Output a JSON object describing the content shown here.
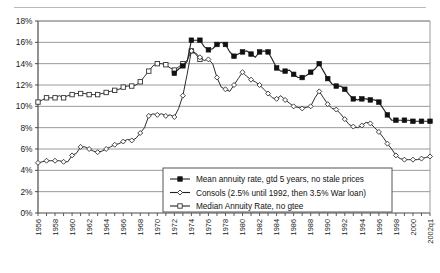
{
  "chart_data": {
    "type": "line",
    "title": "",
    "xlabel": "",
    "ylabel": "",
    "ylim": [
      0,
      18
    ],
    "ytick_labels": [
      "0%",
      "2%",
      "4%",
      "6%",
      "8%",
      "10%",
      "12%",
      "14%",
      "16%",
      "18%"
    ],
    "ytick_values": [
      0,
      2,
      4,
      6,
      8,
      10,
      12,
      14,
      16,
      18
    ],
    "xlim": [
      1956,
      2002
    ],
    "xtick_labels": [
      "1956",
      "1958",
      "1960",
      "1962",
      "1964",
      "1966",
      "1968",
      "1970",
      "1972",
      "1974",
      "1976",
      "1978",
      "1980",
      "1982",
      "1984",
      "1986",
      "1988",
      "1990",
      "1992",
      "1994",
      "1996",
      "1998",
      "2000",
      "2002q1"
    ],
    "xtick_values": [
      1956,
      1958,
      1960,
      1962,
      1964,
      1966,
      1968,
      1970,
      1972,
      1974,
      1976,
      1978,
      1980,
      1982,
      1984,
      1986,
      1988,
      1990,
      1992,
      1994,
      1996,
      1998,
      2000,
      2002
    ],
    "grid": "horizontal",
    "legend_position": "inside-bottom-center",
    "series": [
      {
        "name": "Mean annuity rate, gtd 5 years, no stale prices",
        "marker": "filled-square",
        "x": [
          1972,
          1972.5,
          1973,
          1973.5,
          1974,
          1974.5,
          1975,
          1975.5,
          1976,
          1976.5,
          1977,
          1977.5,
          1978,
          1978.5,
          1979,
          1979.5,
          1980,
          1980.5,
          1981,
          1981.5,
          1982,
          1982.5,
          1983,
          1983.5,
          1984,
          1984.5,
          1985,
          1985.5,
          1986,
          1986.5,
          1987,
          1987.5,
          1988,
          1988.5,
          1989,
          1989.5,
          1990,
          1990.5,
          1991,
          1991.5,
          1992,
          1992.5,
          1993,
          1993.5,
          1994,
          1994.5,
          1995,
          1995.5,
          1996,
          1996.5,
          1997,
          1997.5,
          1998,
          1998.5,
          1999,
          1999.5,
          2000,
          2000.5,
          2001,
          2001.5,
          2002
        ],
        "y": [
          13.1,
          13.5,
          13.8,
          14.2,
          16.2,
          16.2,
          16.2,
          15.6,
          15.3,
          15.4,
          15.8,
          16.0,
          15.8,
          15.1,
          14.7,
          14.9,
          15.1,
          15.2,
          14.9,
          14.6,
          15.1,
          15.2,
          15.1,
          14.4,
          13.6,
          13.3,
          13.3,
          13.4,
          13.0,
          12.7,
          12.7,
          12.9,
          13.2,
          13.5,
          14.0,
          13.3,
          12.6,
          12.1,
          11.9,
          11.9,
          11.6,
          11.1,
          10.7,
          10.6,
          10.7,
          10.7,
          10.6,
          10.6,
          10.4,
          9.8,
          9.2,
          8.7,
          8.7,
          8.7,
          8.7,
          8.7,
          8.6,
          8.6,
          8.6,
          8.6,
          8.6
        ]
      },
      {
        "name": "Consols (2.5% until 1992, then 3.5% War loan)",
        "marker": "open-diamond",
        "x": [
          1956,
          1956.5,
          1957,
          1957.5,
          1958,
          1958.5,
          1959,
          1959.5,
          1960,
          1960.5,
          1961,
          1961.5,
          1962,
          1962.5,
          1963,
          1963.5,
          1964,
          1964.5,
          1965,
          1965.5,
          1966,
          1966.5,
          1967,
          1967.5,
          1968,
          1968.5,
          1969,
          1969.5,
          1970,
          1970.5,
          1971,
          1971.5,
          1972,
          1972.5,
          1973,
          1973.5,
          1974,
          1974.5,
          1975,
          1975.5,
          1976,
          1976.5,
          1977,
          1977.5,
          1978,
          1978.5,
          1979,
          1979.5,
          1980,
          1980.5,
          1981,
          1981.5,
          1982,
          1982.5,
          1983,
          1983.5,
          1984,
          1984.5,
          1985,
          1985.5,
          1986,
          1986.5,
          1987,
          1987.5,
          1988,
          1988.5,
          1989,
          1989.5,
          1990,
          1990.5,
          1991,
          1991.5,
          1992,
          1992.5,
          1993,
          1993.5,
          1994,
          1994.5,
          1995,
          1995.5,
          1996,
          1996.5,
          1997,
          1997.5,
          1998,
          1998.5,
          1999,
          1999.5,
          2000,
          2000.5,
          2001,
          2001.5,
          2002
        ],
        "y": [
          4.7,
          4.8,
          4.9,
          4.9,
          4.9,
          4.9,
          4.8,
          4.8,
          5.4,
          5.6,
          6.2,
          6.2,
          6.0,
          5.8,
          5.7,
          5.8,
          6.0,
          6.2,
          6.4,
          6.5,
          6.7,
          6.9,
          6.8,
          7.0,
          7.5,
          8.0,
          9.1,
          9.3,
          9.2,
          9.3,
          9.1,
          9.2,
          9.0,
          9.8,
          11.0,
          13.0,
          15.2,
          15.0,
          14.6,
          14.3,
          14.4,
          14.0,
          12.7,
          11.8,
          11.6,
          11.4,
          12.0,
          12.6,
          13.2,
          12.8,
          12.5,
          12.3,
          12.0,
          11.6,
          11.2,
          10.8,
          10.7,
          11.0,
          10.6,
          10.3,
          10.0,
          9.9,
          9.8,
          9.9,
          10.0,
          10.8,
          11.4,
          10.8,
          10.2,
          9.8,
          9.7,
          9.3,
          8.8,
          8.3,
          8.1,
          8.0,
          8.2,
          8.5,
          8.4,
          8.0,
          7.6,
          7.1,
          6.5,
          6.0,
          5.4,
          5.1,
          5.0,
          5.0,
          5.0,
          5.0,
          5.1,
          5.2,
          5.3
        ]
      },
      {
        "name": "Median Annuity Rate, no gtee",
        "marker": "open-square",
        "x": [
          1956,
          1956.5,
          1957,
          1957.5,
          1958,
          1958.5,
          1959,
          1959.5,
          1960,
          1960.5,
          1961,
          1961.5,
          1962,
          1962.5,
          1963,
          1963.5,
          1964,
          1964.5,
          1965,
          1965.5,
          1966,
          1966.5,
          1967,
          1967.5,
          1968,
          1968.5,
          1969,
          1969.5,
          1970,
          1970.5,
          1971,
          1971.5,
          1972,
          1972.5,
          1973,
          1973.5,
          1974,
          1974.5,
          1975
        ],
        "y": [
          10.4,
          10.6,
          10.8,
          10.8,
          10.8,
          11.0,
          10.8,
          11.0,
          11.1,
          11.2,
          11.2,
          11.2,
          11.1,
          11.1,
          11.1,
          11.2,
          11.3,
          11.4,
          11.5,
          11.6,
          11.8,
          11.9,
          11.9,
          12.0,
          12.3,
          12.8,
          13.3,
          13.8,
          14.0,
          14.0,
          13.9,
          13.6,
          13.4,
          13.7,
          14.0,
          14.3,
          15.2,
          14.9,
          14.4
        ]
      }
    ]
  },
  "legend": {
    "entries": [
      {
        "label": "Mean annuity rate, gtd 5 years, no stale prices",
        "marker": "filled-square"
      },
      {
        "label": "Consols (2.5% until 1992, then 3.5% War loan)",
        "marker": "open-diamond"
      },
      {
        "label": "Median Annuity Rate, no gtee",
        "marker": "open-square"
      }
    ]
  }
}
